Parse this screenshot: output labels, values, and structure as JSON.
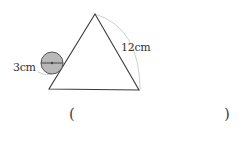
{
  "diagram": {
    "type": "geometry",
    "labels": {
      "side_length": "12cm",
      "circle_diameter": "3cm"
    },
    "answer_blank": {
      "open": "(",
      "close": ")"
    },
    "colors": {
      "triangle_stroke": "#3a3a3a",
      "circle_fill": "#b8b8b8",
      "arc_stroke": "#cfcfcf"
    }
  }
}
